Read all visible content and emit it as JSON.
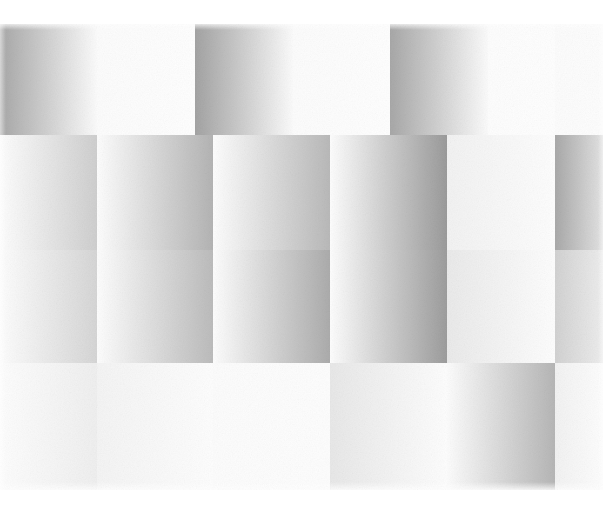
{
  "artwork": {
    "title": "Untitled Gradient Grid",
    "medium_description": "Abstract geometric composition of soft tonal gradient rectangles",
    "canvas": {
      "width": 603,
      "height": 505,
      "background": "#ffffff"
    },
    "plate": {
      "x": 0,
      "y": 24,
      "width": 603,
      "height": 466
    },
    "palette": {
      "paper_white": "#ffffff",
      "near_white": "#fafafa",
      "light_grey": "#ededed",
      "mid_grey": "#c9c9c9",
      "dark_grey": "#a6a6a6",
      "darkest_grey": "#969696"
    },
    "grid": {
      "column_edges_top": [
        0,
        97,
        195,
        293,
        390,
        488,
        603
      ],
      "column_edges_mid": [
        0,
        97,
        213,
        330,
        447,
        555,
        603
      ],
      "band_edges_y": [
        24,
        135,
        250,
        363,
        490
      ],
      "cell_count": 28,
      "gradient_axis": "horizontal",
      "offset_pattern": "alternating half-cell stagger per band"
    },
    "bands": [
      {
        "name": "band-top",
        "y": 24,
        "height": 111,
        "cells": [
          {
            "x": 0,
            "w": 97,
            "from": "#a8a8a8",
            "to": "#fbfbfb",
            "dir": "to right"
          },
          {
            "x": 97,
            "w": 98,
            "from": "#fcfcfc",
            "to": "#fefefe",
            "dir": "to right"
          },
          {
            "x": 195,
            "w": 98,
            "from": "#a3a3a3",
            "to": "#fbfbfb",
            "dir": "to right"
          },
          {
            "x": 293,
            "w": 97,
            "from": "#fcfcfc",
            "to": "#fefefe",
            "dir": "to right"
          },
          {
            "x": 390,
            "w": 98,
            "from": "#a8a8a8",
            "to": "#fbfbfb",
            "dir": "to right"
          },
          {
            "x": 488,
            "w": 67,
            "from": "#fdfdfd",
            "to": "#fefefe",
            "dir": "to right"
          },
          {
            "x": 555,
            "w": 48,
            "from": "#fcfcfc",
            "to": "#fdfdfd",
            "dir": "to right"
          }
        ]
      },
      {
        "name": "band-middle-upper",
        "y": 135,
        "height": 115,
        "cells": [
          {
            "x": 0,
            "w": 97,
            "from": "#fdfdfd",
            "to": "#cfcfcf",
            "dir": "to right"
          },
          {
            "x": 97,
            "w": 116,
            "from": "#fdfdfd",
            "to": "#b4b4b4",
            "dir": "to right"
          },
          {
            "x": 213,
            "w": 117,
            "from": "#fdfdfd",
            "to": "#b9b9b9",
            "dir": "to right"
          },
          {
            "x": 330,
            "w": 117,
            "from": "#fdfdfd",
            "to": "#9b9b9b",
            "dir": "to right"
          },
          {
            "x": 447,
            "w": 108,
            "from": "#f2f2f2",
            "to": "#fdfdfd",
            "dir": "to right"
          },
          {
            "x": 555,
            "w": 48,
            "from": "#a9a9a9",
            "to": "#e3e3e3",
            "dir": "to right"
          }
        ]
      },
      {
        "name": "band-middle-lower",
        "y": 250,
        "height": 113,
        "cells": [
          {
            "x": 0,
            "w": 97,
            "from": "#fdfdfd",
            "to": "#d6d6d6",
            "dir": "to right"
          },
          {
            "x": 97,
            "w": 116,
            "from": "#fdfdfd",
            "to": "#bcbcbc",
            "dir": "to right"
          },
          {
            "x": 213,
            "w": 117,
            "from": "#fdfdfd",
            "to": "#acacac",
            "dir": "to right"
          },
          {
            "x": 330,
            "w": 117,
            "from": "#fdfdfd",
            "to": "#9d9d9d",
            "dir": "to right"
          },
          {
            "x": 447,
            "w": 108,
            "from": "#eaeaea",
            "to": "#fdfdfd",
            "dir": "to right"
          },
          {
            "x": 555,
            "w": 48,
            "from": "#d2d2d2",
            "to": "#ededed",
            "dir": "to right"
          }
        ]
      },
      {
        "name": "band-bottom",
        "y": 363,
        "height": 127,
        "cells": [
          {
            "x": 0,
            "w": 97,
            "from": "#fdfdfd",
            "to": "#efefef",
            "dir": "to right"
          },
          {
            "x": 97,
            "w": 116,
            "from": "#f4f4f4",
            "to": "#fdfdfd",
            "dir": "to right"
          },
          {
            "x": 213,
            "w": 117,
            "from": "#fcfcfc",
            "to": "#fdfdfd",
            "dir": "to right"
          },
          {
            "x": 330,
            "w": 117,
            "from": "#e8e8e8",
            "to": "#fdfdfd",
            "dir": "to right"
          },
          {
            "x": 447,
            "w": 108,
            "from": "#fcfcfc",
            "to": "#b6b6b6",
            "dir": "to right"
          },
          {
            "x": 555,
            "w": 48,
            "from": "#f2f2f2",
            "to": "#fdfdfd",
            "dir": "to right"
          }
        ]
      }
    ]
  }
}
